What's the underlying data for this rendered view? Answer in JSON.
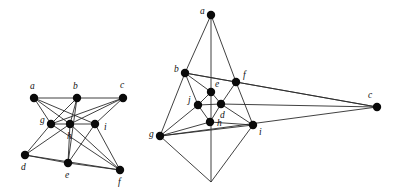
{
  "figure": {
    "background_color": "#ffffff",
    "edge_color": "#2b2b2b",
    "vertex_color": "#0a0a0a",
    "label_color": "#111111",
    "vertex_radius": 4.2
  },
  "graphs": [
    {
      "id": "left-drawing",
      "name": "left-graph-drawing",
      "vertices": [
        {
          "id": "a",
          "label": "a",
          "x": 34,
          "y": 98,
          "label_x": 30,
          "label_y": 87
        },
        {
          "id": "b",
          "label": "b",
          "x": 77,
          "y": 98,
          "label_x": 73,
          "label_y": 87
        },
        {
          "id": "c",
          "label": "c",
          "x": 123,
          "y": 98,
          "label_x": 120,
          "label_y": 86
        },
        {
          "id": "g",
          "label": "g",
          "x": 51,
          "y": 124,
          "label_x": 40,
          "label_y": 121
        },
        {
          "id": "h",
          "label": "h",
          "x": 70,
          "y": 124,
          "label_x": 67,
          "label_y": 137
        },
        {
          "id": "i",
          "label": "i",
          "x": 95,
          "y": 124,
          "label_x": 104,
          "label_y": 128
        },
        {
          "id": "d",
          "label": "d",
          "x": 25,
          "y": 155,
          "label_x": 21,
          "label_y": 168
        },
        {
          "id": "e",
          "label": "e",
          "x": 68,
          "y": 163,
          "label_x": 65,
          "label_y": 176
        },
        {
          "id": "f",
          "label": "f",
          "x": 120,
          "y": 170,
          "label_x": 118,
          "label_y": 183
        }
      ],
      "edges": [
        [
          "a",
          "b"
        ],
        [
          "b",
          "c"
        ],
        [
          "a",
          "g"
        ],
        [
          "a",
          "h"
        ],
        [
          "a",
          "i"
        ],
        [
          "b",
          "g"
        ],
        [
          "b",
          "h"
        ],
        [
          "b",
          "e"
        ],
        [
          "c",
          "g"
        ],
        [
          "c",
          "h"
        ],
        [
          "c",
          "i"
        ],
        [
          "g",
          "h"
        ],
        [
          "h",
          "i"
        ],
        [
          "d",
          "g"
        ],
        [
          "d",
          "h"
        ],
        [
          "d",
          "e"
        ],
        [
          "d",
          "f"
        ],
        [
          "e",
          "h"
        ],
        [
          "e",
          "i"
        ],
        [
          "e",
          "f"
        ],
        [
          "f",
          "g"
        ],
        [
          "f",
          "h"
        ],
        [
          "f",
          "i"
        ]
      ]
    },
    {
      "id": "right-drawing",
      "name": "right-graph-drawing",
      "vertices": [
        {
          "id": "a",
          "label": "a",
          "x": 211,
          "y": 15,
          "label_x": 200,
          "label_y": 12
        },
        {
          "id": "b",
          "label": "b",
          "x": 185,
          "y": 73,
          "label_x": 174,
          "label_y": 70
        },
        {
          "id": "f",
          "label": "f",
          "x": 236,
          "y": 82,
          "label_x": 243,
          "label_y": 76
        },
        {
          "id": "e",
          "label": "e",
          "x": 211,
          "y": 92,
          "label_x": 215,
          "label_y": 85
        },
        {
          "id": "j",
          "label": "j",
          "x": 198,
          "y": 105,
          "label_x": 188,
          "label_y": 101
        },
        {
          "id": "d",
          "label": "d",
          "x": 221,
          "y": 104,
          "label_x": 220,
          "label_y": 116
        },
        {
          "id": "h",
          "label": "h",
          "x": 210,
          "y": 122,
          "label_x": 217,
          "label_y": 124
        },
        {
          "id": "i",
          "label": "i",
          "x": 253,
          "y": 125,
          "label_x": 259,
          "label_y": 133
        },
        {
          "id": "g",
          "label": "g",
          "x": 160,
          "y": 136,
          "label_x": 149,
          "label_y": 135
        },
        {
          "id": "c",
          "label": "c",
          "x": 377,
          "y": 107,
          "label_x": 368,
          "label_y": 96
        }
      ],
      "apex": {
        "id": "apex",
        "x": 211,
        "y": 182
      },
      "edges": [
        [
          "a",
          "b"
        ],
        [
          "a",
          "f"
        ],
        [
          "a",
          "apex"
        ],
        [
          "b",
          "f"
        ],
        [
          "b",
          "g"
        ],
        [
          "b",
          "j"
        ],
        [
          "b",
          "c"
        ],
        [
          "f",
          "d"
        ],
        [
          "f",
          "i"
        ],
        [
          "f",
          "c"
        ],
        [
          "e",
          "j"
        ],
        [
          "e",
          "d"
        ],
        [
          "e",
          "b"
        ],
        [
          "j",
          "d"
        ],
        [
          "j",
          "h"
        ],
        [
          "j",
          "g"
        ],
        [
          "d",
          "h"
        ],
        [
          "d",
          "i"
        ],
        [
          "d",
          "c"
        ],
        [
          "h",
          "g"
        ],
        [
          "h",
          "i"
        ],
        [
          "g",
          "i"
        ],
        [
          "g",
          "apex"
        ],
        [
          "g",
          "c"
        ],
        [
          "i",
          "apex"
        ]
      ]
    }
  ]
}
